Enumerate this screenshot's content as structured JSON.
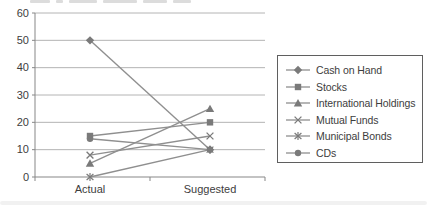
{
  "chart_data": {
    "type": "line",
    "title": "",
    "categories": [
      "Actual",
      "Suggested"
    ],
    "series": [
      {
        "name": "Cash on Hand",
        "marker": "diamond",
        "values": [
          50,
          10
        ]
      },
      {
        "name": "Stocks",
        "marker": "square",
        "values": [
          15,
          20
        ]
      },
      {
        "name": "International Holdings",
        "marker": "triangle",
        "values": [
          5,
          25
        ]
      },
      {
        "name": "Mutual Funds",
        "marker": "x",
        "values": [
          8,
          15
        ]
      },
      {
        "name": "Municipal Bonds",
        "marker": "asterisk",
        "values": [
          0,
          10
        ]
      },
      {
        "name": "CDs",
        "marker": "circle",
        "values": [
          14,
          10
        ]
      }
    ],
    "xlabel": "",
    "ylabel": "",
    "ylim": [
      0,
      60
    ],
    "yticks": [
      0,
      10,
      20,
      30,
      40,
      50,
      60
    ],
    "grid": true,
    "legend_position": "right",
    "colors": {
      "series_line": "#8f8f8f",
      "marker": "#7a7a7a",
      "gridline": "#b4b4b4",
      "axis": "#878787",
      "text": "#3d3d3d"
    }
  }
}
